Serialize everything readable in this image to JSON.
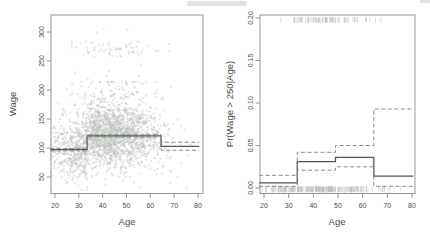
{
  "figure": {
    "panels": [
      "wage-age-scatter",
      "wage-probability"
    ]
  },
  "colors": {
    "background": "#ffffff",
    "fit_line": "#50584f",
    "band_line": "#898e88",
    "scatter_point": "#bcc1bc",
    "rug": "#b4b9b4",
    "axis": "#8a8f8a",
    "text": "#4a4a4a",
    "artifact": "#dcdedc"
  },
  "chart_data": [
    {
      "type": "scatter",
      "title": "",
      "xlabel": "Age",
      "ylabel": "Wage",
      "xlim": [
        18,
        82
      ],
      "ylim": [
        20,
        330
      ],
      "xticks": [
        20,
        30,
        40,
        50,
        60,
        70,
        80
      ],
      "yticks": [
        50,
        100,
        150,
        200,
        250,
        300
      ],
      "ytick_labels": [
        "50",
        "100",
        "150",
        "200",
        "250",
        "300"
      ],
      "grid": false,
      "legend": null,
      "scatter_cloud": {
        "n_points": 2400,
        "age_mean": 42,
        "age_sd": 11.5,
        "age_range": [
          18,
          80
        ],
        "wage_noise_sd": 27,
        "wage_range": [
          28,
          214
        ],
        "n_outliers": 78,
        "outlier_band_wage_mean": 270,
        "outlier_band_wage_sd": 7,
        "outlier_band_wage_range": [
          256,
          318
        ],
        "outlier_age_mean": 45,
        "outlier_age_sd": 9,
        "outlier_age_range": [
          27,
          68
        ],
        "seed": 20
      },
      "step_fit": {
        "breaks": [
          18,
          33.5,
          64.5,
          80.5
        ],
        "fit": [
          97,
          121,
          103
        ],
        "upper": [
          99,
          123,
          110
        ],
        "lower": [
          95,
          119,
          96
        ]
      }
    },
    {
      "type": "line",
      "title": "",
      "xlabel": "Age",
      "ylabel": "Pr(Wage > 250|Age)",
      "xlim": [
        18,
        82
      ],
      "ylim": [
        0,
        0.208
      ],
      "xticks": [
        20,
        30,
        40,
        50,
        60,
        70,
        80
      ],
      "yticks": [
        0,
        0.05,
        0.1,
        0.15,
        0.2
      ],
      "ytick_labels": [
        "0.00",
        "0.05",
        "0.10",
        "0.15",
        "0.20"
      ],
      "grid": false,
      "legend": null,
      "step_fit": {
        "breaks": [
          18,
          33.5,
          49,
          64.5,
          80.5
        ],
        "fit": [
          0.006,
          0.031,
          0.036,
          0.014
        ],
        "upper": [
          0.015,
          0.042,
          0.05,
          0.093
        ],
        "lower": [
          0.002,
          0.021,
          0.025,
          0.002
        ]
      },
      "rug_top": {
        "n": 72,
        "age_mean": 46,
        "age_sd": 9,
        "age_range": [
          25,
          70
        ],
        "seed": 7
      },
      "rug_bottom": {
        "n": 230,
        "age_mean": 42,
        "age_sd": 11.5,
        "age_range": [
          18,
          80
        ],
        "seed": 11
      }
    }
  ]
}
